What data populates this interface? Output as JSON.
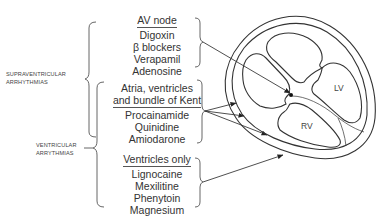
{
  "left_labels": {
    "supraventricular": [
      "SUPRAVENTRICULAR",
      "ARRHYTHMIAS"
    ],
    "ventricular": [
      "VENTRICULAR",
      "ARRYTHMIAS"
    ]
  },
  "groups": [
    {
      "heading": "AV node",
      "drugs": [
        "Digoxin",
        "β blockers",
        "Verapamil",
        "Adenosine"
      ]
    },
    {
      "heading_lines": [
        "Atria, ventricles",
        "and bundle of Kent"
      ],
      "drugs": [
        "Procainamide",
        "Quinidine",
        "Amiodarone"
      ]
    },
    {
      "heading": "Ventricles only",
      "drugs": [
        "Lignocaine",
        "Mexilitine",
        "Phenytoin",
        "Magnesium"
      ]
    }
  ],
  "heart": {
    "lv_label": "LV",
    "rv_label": "RV"
  }
}
